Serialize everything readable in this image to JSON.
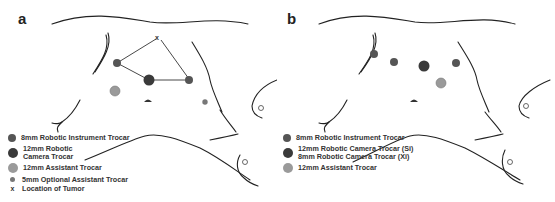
{
  "panels": [
    {
      "label": "a",
      "legend": [
        {
          "symbol": "8mm-dot",
          "color": "#555555",
          "text": "8mm Robotic Instrument Trocar"
        },
        {
          "symbol": "12mm-dot",
          "color": "#3a3a3a",
          "text": "12mm Robotic Camera Trocar"
        },
        {
          "symbol": "12mm-assistant-dot",
          "color": "#9a9a9a",
          "text": "12mm Assistant Trocar"
        },
        {
          "symbol": "5mm-dot",
          "color": "#777777",
          "text": "5mm Optional Assistant Trocar"
        },
        {
          "symbol": "x",
          "color": "#333333",
          "text": "Location of Tumor"
        }
      ],
      "tumor_marker": "x"
    },
    {
      "label": "b",
      "legend": [
        {
          "symbol": "8mm-dot",
          "color": "#555555",
          "text": "8mm Robotic Instrument Trocar"
        },
        {
          "symbol": "12mm-dot",
          "color": "#3a3a3a",
          "text": "12mm Robotic Camera Trocar (Si)",
          "text2": "8mm Robotic Camera Trocar (Xi)"
        },
        {
          "symbol": "12mm-assistant-dot",
          "color": "#9a9a9a",
          "text": "12mm Assistant Trocar"
        }
      ]
    }
  ]
}
